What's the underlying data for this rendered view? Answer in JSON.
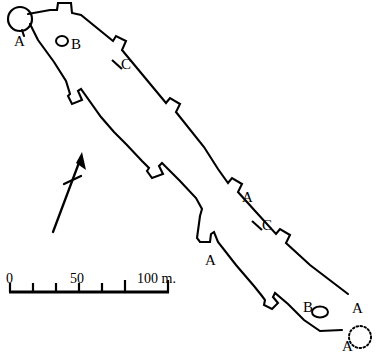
{
  "figure": {
    "kind": "archaeological-site-plan",
    "ink_color": "#000000",
    "background_color": "#ffffff"
  },
  "map_labels": [
    {
      "id": "a-top-left",
      "text": "A",
      "x": 14,
      "y": 34
    },
    {
      "id": "b-top-left",
      "text": "B",
      "x": 71,
      "y": 37
    },
    {
      "id": "c-upper-wall",
      "text": "C",
      "x": 121,
      "y": 57
    },
    {
      "id": "a-mid-right",
      "text": "A",
      "x": 242,
      "y": 190
    },
    {
      "id": "c-mid-right",
      "text": "C",
      "x": 262,
      "y": 218
    },
    {
      "id": "a-mid-left",
      "text": "A",
      "x": 205,
      "y": 253
    },
    {
      "id": "b-bottom-right",
      "text": "B",
      "x": 303,
      "y": 300
    },
    {
      "id": "a-bottom-right",
      "text": "A",
      "x": 352,
      "y": 301
    },
    {
      "id": "a-bottom-lower",
      "text": "A",
      "x": 342,
      "y": 339
    }
  ],
  "scale_bar": {
    "unit_suffix": "m.",
    "ticks": [
      {
        "label": "0",
        "value": 0,
        "x": 8
      },
      {
        "label": "",
        "value": 10,
        "x": 31
      },
      {
        "label": "",
        "value": 20,
        "x": 54
      },
      {
        "label": "",
        "value": 30,
        "x": 77
      },
      {
        "label": "",
        "value": 40,
        "x": 100
      },
      {
        "label": "50",
        "value": 50,
        "x": 123
      },
      {
        "label": "100",
        "value": 100,
        "x": 169
      }
    ],
    "labels": [
      {
        "id": "scale-0",
        "text": "0",
        "x": 6,
        "y": 272
      },
      {
        "id": "scale-50",
        "text": "50",
        "x": 70,
        "y": 272
      },
      {
        "id": "scale-100",
        "text": "100 m.",
        "x": 137,
        "y": 272
      }
    ]
  },
  "north_arrow": {
    "id": "north-arrow",
    "description": "north indicator"
  }
}
